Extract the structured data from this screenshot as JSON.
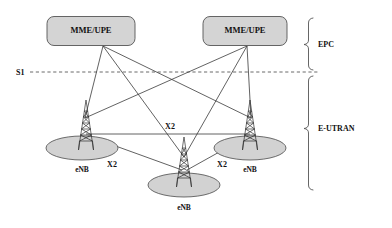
{
  "diagram": {
    "colors": {
      "node_fill": "#d4d4d4",
      "coverage_fill": "#d2d2d2",
      "line": "#3a3a3a",
      "text": "#111111",
      "background": "#ffffff"
    }
  },
  "core_nodes": [
    {
      "id": "mme-upe-left",
      "label": "MME/UPE",
      "x": 91,
      "y": 31,
      "w": 88,
      "h": 29
    },
    {
      "id": "mme-upe-right",
      "label": "MME/UPE",
      "x": 245,
      "y": 31,
      "w": 84,
      "h": 29
    }
  ],
  "access_nodes": [
    {
      "id": "enb-left",
      "label": "eNB",
      "x": 82,
      "y": 148,
      "label_y": 172
    },
    {
      "id": "enb-center",
      "label": "eNB",
      "x": 184,
      "y": 185,
      "label_y": 210
    },
    {
      "id": "enb-right",
      "label": "eNB",
      "x": 250,
      "y": 148,
      "label_y": 172
    }
  ],
  "interfaces": {
    "s1": {
      "label": "S1",
      "label_x": 18,
      "label_y": 75,
      "line_y": 72,
      "line_x_start": 30,
      "line_x_end": 318,
      "style": "dashed"
    },
    "x2_links": [
      {
        "label": "X2",
        "x": 170,
        "y": 129
      },
      {
        "label": "X2",
        "x": 112,
        "y": 167
      },
      {
        "label": "X2",
        "x": 222,
        "y": 167
      }
    ]
  },
  "zones": [
    {
      "id": "epc",
      "label": "EPC",
      "label_x": 334,
      "label_y": 46,
      "brace_top": 18,
      "brace_bottom": 70
    },
    {
      "id": "e-utran",
      "label": "E-UTRAN",
      "label_x": 334,
      "label_y": 130,
      "brace_top": 76,
      "brace_bottom": 190
    }
  ]
}
